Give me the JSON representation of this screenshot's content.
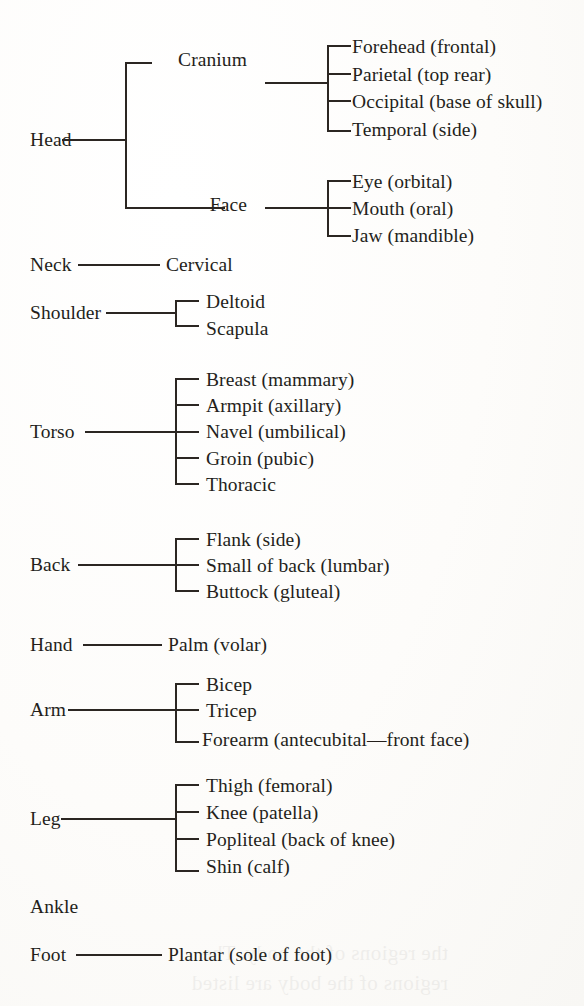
{
  "page": {
    "background_color": "#fdfcfa",
    "ink_color": "#241f1b",
    "bleed_through_text": "the regions of the body. The\nregions of the body are listed"
  },
  "diagram": {
    "type": "tree",
    "orientation": "left-to-right",
    "depth": 3,
    "root_items": [
      {
        "label": "Head",
        "x": 30,
        "y": 145,
        "connector": {
          "x1": 62,
          "x2": 125,
          "y": 139
        },
        "bracket": {
          "x": 125,
          "y_top": 62,
          "y_bottom": 207
        },
        "children": [
          {
            "label": "Cranium",
            "x": 247,
            "y": 65,
            "align": "right",
            "stub": {
              "x1": 125,
              "x2": 152,
              "y": 62
            },
            "connector": {
              "x1": 265,
              "x2": 327,
              "y": 82
            },
            "bracket": {
              "x": 327,
              "y_top": 45,
              "y_bottom": 130
            },
            "children": [
              {
                "label": "Forehead (frontal)",
                "x": 352,
                "y": 52,
                "stub_y": 45
              },
              {
                "label": "Parietal (top rear)",
                "x": 352,
                "y": 80,
                "stub_y": 73
              },
              {
                "label": "Occipital (base of skull)",
                "x": 352,
                "y": 107,
                "stub_y": 100
              },
              {
                "label": "Temporal (side)",
                "x": 352,
                "y": 135,
                "stub_y": 130
              }
            ]
          },
          {
            "label": "Face",
            "x": 247,
            "y": 210,
            "align": "right",
            "stub": {
              "x1": 125,
              "x2": 225,
              "y": 207
            },
            "connector": {
              "x1": 265,
              "x2": 327,
              "y": 207
            },
            "bracket": {
              "x": 327,
              "y_top": 180,
              "y_bottom": 235
            },
            "children": [
              {
                "label": "Eye (orbital)",
                "x": 352,
                "y": 187,
                "stub_y": 180
              },
              {
                "label": "Mouth (oral)",
                "x": 352,
                "y": 214,
                "stub_y": 207
              },
              {
                "label": "Jaw (mandible)",
                "x": 352,
                "y": 241,
                "stub_y": 235
              }
            ]
          }
        ]
      },
      {
        "label": "Neck",
        "x": 30,
        "y": 270,
        "connector": {
          "x1": 78,
          "x2": 160,
          "y": 264
        },
        "children": [
          {
            "label": "Cervical",
            "x": 166,
            "y": 270
          }
        ]
      },
      {
        "label": "Shoulder",
        "x": 30,
        "y": 318,
        "connector": {
          "x1": 106,
          "x2": 175,
          "y": 312
        },
        "bracket": {
          "x": 175,
          "y_top": 300,
          "y_bottom": 325
        },
        "children": [
          {
            "label": "Deltoid",
            "x": 206,
            "y": 307,
            "stub_y": 300
          },
          {
            "label": "Scapula",
            "x": 206,
            "y": 334,
            "stub_y": 325
          }
        ]
      },
      {
        "label": "Torso",
        "x": 30,
        "y": 437,
        "connector": {
          "x1": 85,
          "x2": 175,
          "y": 431
        },
        "bracket": {
          "x": 175,
          "y_top": 378,
          "y_bottom": 483
        },
        "children": [
          {
            "label": "Breast (mammary)",
            "x": 206,
            "y": 385,
            "stub_y": 378
          },
          {
            "label": "Armpit (axillary)",
            "x": 206,
            "y": 411,
            "stub_y": 404
          },
          {
            "label": "Navel (umbilical)",
            "x": 206,
            "y": 437,
            "stub_y": 431
          },
          {
            "label": "Groin (pubic)",
            "x": 206,
            "y": 464,
            "stub_y": 457
          },
          {
            "label": "Thoracic",
            "x": 206,
            "y": 490,
            "stub_y": 483
          }
        ]
      },
      {
        "label": "Back",
        "x": 30,
        "y": 570,
        "connector": {
          "x1": 78,
          "x2": 175,
          "y": 564
        },
        "bracket": {
          "x": 175,
          "y_top": 538,
          "y_bottom": 590
        },
        "children": [
          {
            "label": "Flank (side)",
            "x": 206,
            "y": 545,
            "stub_y": 538
          },
          {
            "label": "Small of back (lumbar)",
            "x": 206,
            "y": 571,
            "stub_y": 564
          },
          {
            "label": "Buttock (gluteal)",
            "x": 206,
            "y": 597,
            "stub_y": 590
          }
        ]
      },
      {
        "label": "Hand",
        "x": 30,
        "y": 650,
        "connector": {
          "x1": 83,
          "x2": 162,
          "y": 644
        },
        "children": [
          {
            "label": "Palm (volar)",
            "x": 168,
            "y": 650
          }
        ]
      },
      {
        "label": "Arm",
        "x": 30,
        "y": 715,
        "connector": {
          "x1": 68,
          "x2": 175,
          "y": 709
        },
        "bracket": {
          "x": 175,
          "y_top": 683,
          "y_bottom": 741
        },
        "children": [
          {
            "label": "Bicep",
            "x": 206,
            "y": 690,
            "stub_y": 683
          },
          {
            "label": "Tricep",
            "x": 206,
            "y": 716,
            "stub_y": 709
          },
          {
            "label": "Forearm (antecubital—front face)",
            "x": 202,
            "y": 745,
            "stub_y": 741
          }
        ]
      },
      {
        "label": "Leg",
        "x": 30,
        "y": 824,
        "connector": {
          "x1": 61,
          "x2": 175,
          "y": 818
        },
        "bracket": {
          "x": 175,
          "y_top": 784,
          "y_bottom": 870
        },
        "children": [
          {
            "label": "Thigh (femoral)",
            "x": 206,
            "y": 791,
            "stub_y": 784
          },
          {
            "label": "Knee (patella)",
            "x": 206,
            "y": 818,
            "stub_y": 811
          },
          {
            "label": "Popliteal (back of knee)",
            "x": 206,
            "y": 845,
            "stub_y": 838
          },
          {
            "label": "Shin (calf)",
            "x": 206,
            "y": 872,
            "stub_y": 870
          }
        ]
      },
      {
        "label": "Ankle",
        "x": 30,
        "y": 912,
        "children": []
      },
      {
        "label": "Foot",
        "x": 30,
        "y": 960,
        "connector": {
          "x1": 76,
          "x2": 162,
          "y": 954
        },
        "children": [
          {
            "label": "Plantar (sole of foot)",
            "x": 168,
            "y": 960
          }
        ]
      }
    ]
  }
}
